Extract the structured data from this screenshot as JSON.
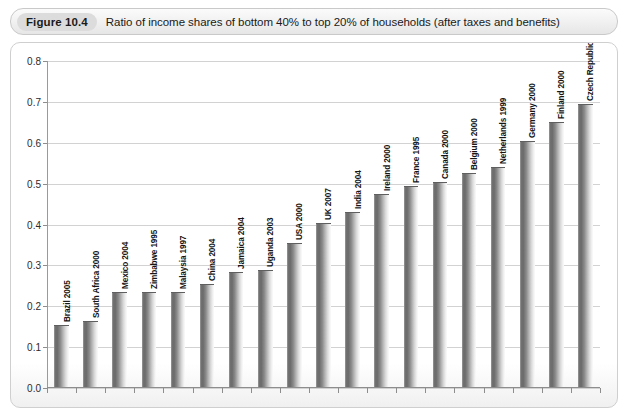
{
  "figure": {
    "number_label": "Figure 10.4",
    "caption": "Ratio of income shares of bottom 40% to top 20% of households (after taxes and benefits)"
  },
  "chart_data": {
    "type": "bar",
    "title": "Ratio of income shares of bottom 40% to top 20% of households (after taxes and benefits)",
    "xlabel": "",
    "ylabel": "",
    "ylim": [
      0.0,
      0.8
    ],
    "ytick_labels": [
      "0.0",
      "0.1",
      "0.2",
      "0.3",
      "0.4",
      "0.5",
      "0.6",
      "0.7",
      "0.8"
    ],
    "ytick_values": [
      0.0,
      0.1,
      0.2,
      0.3,
      0.4,
      0.5,
      0.6,
      0.7,
      0.8
    ],
    "grid": true,
    "legend": "none",
    "categories": [
      "Brazil 2005",
      "South Africa 2000",
      "Mexico 2004",
      "Zimbabwe 1995",
      "Malaysia 1997",
      "China 2004",
      "Jamaica 2004",
      "Uganda 2003",
      "USA 2000",
      "UK 2007",
      "India 2004",
      "Ireland 2000",
      "France 1995",
      "Canada 2000",
      "Belgium 2000",
      "Netherlands 1999",
      "Germany 2000",
      "Finland 2000",
      "Czech Republic 1996"
    ],
    "values": [
      0.15,
      0.16,
      0.23,
      0.23,
      0.23,
      0.25,
      0.28,
      0.285,
      0.35,
      0.4,
      0.425,
      0.47,
      0.49,
      0.5,
      0.52,
      0.535,
      0.6,
      0.645,
      0.69
    ]
  },
  "colors": {
    "bar_dark": "#6b6b6b",
    "bar_light": "#fbfbfb",
    "gridline": "#d2d2d2",
    "axis": "#8d8d8d",
    "badge_background": "#dcdcdc",
    "frame_border": "#cfcfcf"
  }
}
